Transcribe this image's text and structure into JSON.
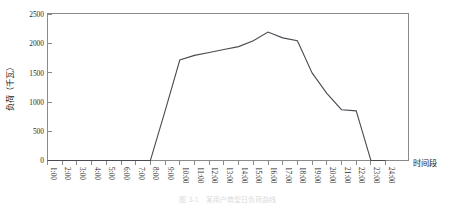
{
  "figure": {
    "caption": "图 3-1　某用户典型日负荷曲线"
  },
  "axes": {
    "y_title": "负荷（千瓦）",
    "x_title": "时间段",
    "y_ticks": [
      "0",
      "500",
      "1000",
      "1500",
      "2000",
      "2500"
    ],
    "x_ticks": [
      "1:00",
      "2:00",
      "3:00",
      "4:00",
      "5:00",
      "6:00",
      "7:00",
      "8:00",
      "9:00",
      "10:00",
      "11:00",
      "12:00",
      "13:00",
      "14:00",
      "15:00",
      "16:00",
      "17:00",
      "18:00",
      "19:00",
      "20:00",
      "21:00",
      "22:00",
      "23:00",
      "24:00"
    ]
  },
  "colors": {
    "line": "#4a4a52",
    "axis": "#8a8a8a",
    "text": "#1a1a1a",
    "background": "#ffffff"
  },
  "chart_data": {
    "type": "line",
    "title": "",
    "xlabel": "时间段",
    "ylabel": "负荷（千瓦）",
    "xlim": [
      1,
      24
    ],
    "ylim": [
      0,
      2500
    ],
    "ytick_values": [
      0,
      500,
      1000,
      1500,
      2000,
      2500
    ],
    "grid": false,
    "legend": null,
    "x": [
      "1:00",
      "2:00",
      "3:00",
      "4:00",
      "5:00",
      "6:00",
      "7:00",
      "8:00",
      "9:00",
      "10:00",
      "11:00",
      "12:00",
      "13:00",
      "14:00",
      "15:00",
      "16:00",
      "17:00",
      "18:00",
      "19:00",
      "20:00",
      "21:00",
      "22:00",
      "23:00",
      "24:00"
    ],
    "values": [
      0,
      0,
      0,
      0,
      0,
      0,
      0,
      0,
      850,
      1720,
      1800,
      1850,
      1900,
      1950,
      2050,
      2200,
      2100,
      2050,
      1500,
      1150,
      870,
      850,
      0,
      0
    ]
  }
}
